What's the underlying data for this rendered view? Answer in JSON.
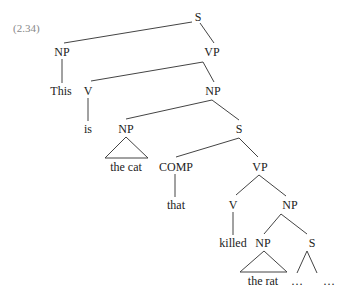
{
  "example_number": "(2.34)",
  "nodes": {
    "s_root": {
      "label": "S",
      "x": 198,
      "y": 17
    },
    "np_subj": {
      "label": "NP",
      "x": 62,
      "y": 52
    },
    "vp_main": {
      "label": "VP",
      "x": 212,
      "y": 52
    },
    "word_this": {
      "label": "This",
      "x": 61,
      "y": 91
    },
    "v_is": {
      "label": "V",
      "x": 88,
      "y": 91
    },
    "np_pred": {
      "label": "NP",
      "x": 213,
      "y": 91
    },
    "word_is": {
      "label": "is",
      "x": 88,
      "y": 129
    },
    "np_cat": {
      "label": "NP",
      "x": 126,
      "y": 129
    },
    "s_rel": {
      "label": "S",
      "x": 239,
      "y": 129
    },
    "word_the_cat": {
      "label": "the cat",
      "x": 126,
      "y": 167
    },
    "comp": {
      "label": "COMP",
      "x": 176,
      "y": 167
    },
    "vp_rel": {
      "label": "VP",
      "x": 260,
      "y": 167
    },
    "word_that": {
      "label": "that",
      "x": 176,
      "y": 205
    },
    "v_killed": {
      "label": "V",
      "x": 233,
      "y": 205
    },
    "np_obj": {
      "label": "NP",
      "x": 290,
      "y": 205
    },
    "word_killed": {
      "label": "killed",
      "x": 233,
      "y": 243
    },
    "np_rat": {
      "label": "NP",
      "x": 263,
      "y": 243
    },
    "s_cont": {
      "label": "S",
      "x": 312,
      "y": 243
    },
    "word_the_rat": {
      "label": "the rat",
      "x": 263,
      "y": 281
    },
    "ellipsis_1": {
      "label": "…",
      "x": 297,
      "y": 281
    },
    "ellipsis_2": {
      "label": "…",
      "x": 329,
      "y": 281
    }
  },
  "edges": [
    {
      "from": "s_root",
      "to": "np_subj",
      "x1": 192,
      "y1": 22,
      "x2": 64,
      "y2": 43
    },
    {
      "from": "s_root",
      "to": "vp_main",
      "x1": 200,
      "y1": 23,
      "x2": 214,
      "y2": 43
    },
    {
      "from": "np_subj",
      "to": "word_this",
      "x1": 62,
      "y1": 59,
      "x2": 62,
      "y2": 83
    },
    {
      "from": "vp_main",
      "to": "v_is",
      "x1": 203,
      "y1": 62,
      "x2": 91,
      "y2": 81
    },
    {
      "from": "vp_main",
      "to": "np_pred",
      "x1": 203,
      "y1": 62,
      "x2": 214,
      "y2": 82
    },
    {
      "from": "v_is",
      "to": "word_is",
      "x1": 88,
      "y1": 98,
      "x2": 88,
      "y2": 121
    },
    {
      "from": "np_pred",
      "to": "np_cat",
      "x1": 212,
      "y1": 100,
      "x2": 126,
      "y2": 119
    },
    {
      "from": "np_pred",
      "to": "s_rel",
      "x1": 212,
      "y1": 100,
      "x2": 239,
      "y2": 120
    },
    {
      "from": "s_rel",
      "to": "comp",
      "x1": 239,
      "y1": 138,
      "x2": 176,
      "y2": 157
    },
    {
      "from": "s_rel",
      "to": "vp_rel",
      "x1": 239,
      "y1": 138,
      "x2": 258,
      "y2": 157
    },
    {
      "from": "comp",
      "to": "word_that",
      "x1": 175,
      "y1": 174,
      "x2": 175,
      "y2": 197
    },
    {
      "from": "vp_rel",
      "to": "v_killed",
      "x1": 259,
      "y1": 175,
      "x2": 236,
      "y2": 195
    },
    {
      "from": "vp_rel",
      "to": "np_obj",
      "x1": 259,
      "y1": 175,
      "x2": 286,
      "y2": 196
    },
    {
      "from": "v_killed",
      "to": "word_killed",
      "x1": 233,
      "y1": 212,
      "x2": 233,
      "y2": 235
    },
    {
      "from": "np_obj",
      "to": "np_rat",
      "x1": 281,
      "y1": 214,
      "x2": 264,
      "y2": 234
    },
    {
      "from": "np_obj",
      "to": "s_cont",
      "x1": 281,
      "y1": 214,
      "x2": 307,
      "y2": 234
    },
    {
      "from": "s_cont",
      "to": "ellipsis_1",
      "x1": 307,
      "y1": 251,
      "x2": 297,
      "y2": 273
    },
    {
      "from": "s_cont",
      "to": "ellipsis_2",
      "x1": 307,
      "y1": 251,
      "x2": 317,
      "y2": 273
    }
  ],
  "triangles": [
    {
      "of": "np_cat",
      "apex_x": 126,
      "apex_y": 137,
      "left_x": 105,
      "right_x": 148,
      "base_y": 158
    },
    {
      "of": "np_rat",
      "apex_x": 264,
      "apex_y": 251,
      "left_x": 240,
      "right_x": 287,
      "base_y": 272
    }
  ]
}
